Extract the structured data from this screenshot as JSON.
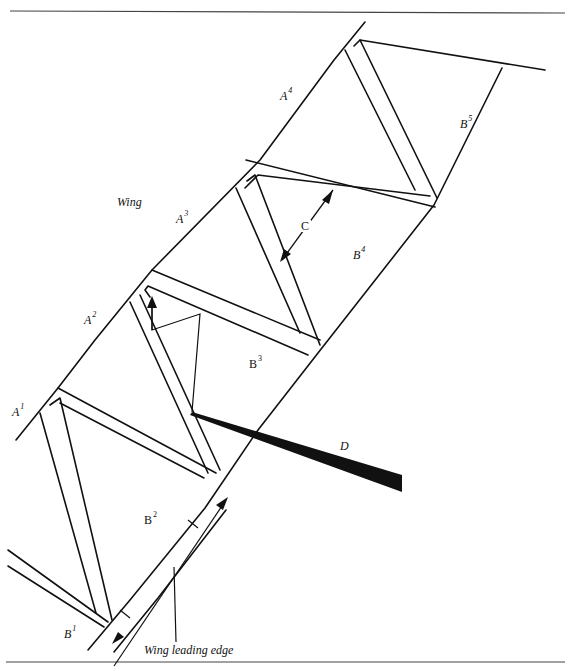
{
  "figure": {
    "labels": {
      "wing": "Wing",
      "wing_leading_edge": "Wing leading edge",
      "C": "C",
      "D": "D"
    },
    "panels_A": [
      {
        "letter": "A",
        "index": "1"
      },
      {
        "letter": "A",
        "index": "2"
      },
      {
        "letter": "A",
        "index": "3"
      },
      {
        "letter": "A",
        "index": "4"
      }
    ],
    "panels_B": [
      {
        "letter": "B",
        "index": "1"
      },
      {
        "letter": "B",
        "index": "2"
      },
      {
        "letter": "B",
        "index": "3"
      },
      {
        "letter": "B",
        "index": "4"
      },
      {
        "letter": "B",
        "index": "5"
      }
    ],
    "colors": {
      "line": "#111111",
      "background": "#ffffff"
    }
  }
}
